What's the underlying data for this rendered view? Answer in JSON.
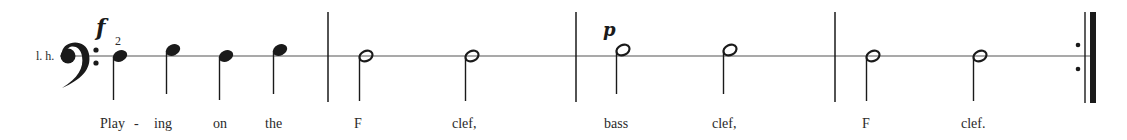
{
  "score": {
    "hand_label": "l. h.",
    "clef": "bass",
    "clef_glyph": "𝄢",
    "staff_line_y": 56,
    "colors": {
      "ink": "#1a1a1a",
      "staff": "#555555",
      "text": "#2a2a2a"
    },
    "dynamics": [
      {
        "mark": "f",
        "x": 96,
        "y": 14
      },
      {
        "mark": "p",
        "x": 603,
        "y": 20
      }
    ],
    "fingering": {
      "value": "2",
      "x": 115,
      "y": 35
    },
    "measures": [
      {
        "number": 1,
        "notes": [
          {
            "type": "quarter",
            "position": "line",
            "x": 113,
            "lyric": "Play"
          },
          {
            "type": "quarter",
            "position": "space-above",
            "x": 166,
            "lyric": "ing"
          },
          {
            "type": "quarter",
            "position": "line",
            "x": 219,
            "lyric": "on"
          },
          {
            "type": "quarter",
            "position": "space-above",
            "x": 273,
            "lyric": "the"
          }
        ]
      },
      {
        "number": 2,
        "notes": [
          {
            "type": "half",
            "position": "line",
            "x": 359,
            "lyric": "F"
          },
          {
            "type": "half",
            "position": "line",
            "x": 465,
            "lyric": "clef,"
          }
        ]
      },
      {
        "number": 3,
        "notes": [
          {
            "type": "half",
            "position": "space-above",
            "x": 616,
            "lyric": "bass"
          },
          {
            "type": "half",
            "position": "space-above",
            "x": 723,
            "lyric": "clef,"
          }
        ]
      },
      {
        "number": 4,
        "notes": [
          {
            "type": "half",
            "position": "line",
            "x": 866,
            "lyric": "F"
          },
          {
            "type": "half",
            "position": "line",
            "x": 973,
            "lyric": "clef."
          }
        ]
      }
    ],
    "barlines_x": [
      328,
      576,
      835
    ],
    "final_barline": "end-repeat",
    "lyrics": [
      {
        "text": "Play",
        "x": 100
      },
      {
        "text": "-",
        "x": 134
      },
      {
        "text": "ing",
        "x": 154
      },
      {
        "text": "on",
        "x": 213
      },
      {
        "text": "the",
        "x": 265
      },
      {
        "text": "F",
        "x": 354
      },
      {
        "text": "clef,",
        "x": 452
      },
      {
        "text": "bass",
        "x": 604
      },
      {
        "text": "clef,",
        "x": 712
      },
      {
        "text": "F",
        "x": 862
      },
      {
        "text": "clef.",
        "x": 961
      }
    ]
  }
}
